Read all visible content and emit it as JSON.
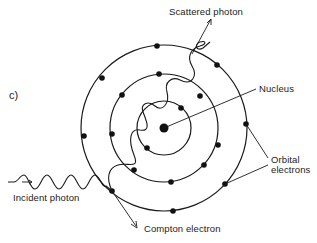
{
  "figure": {
    "panel_label": "c)"
  },
  "labels": {
    "scattered_photon": "Scattered photon",
    "nucleus": "Nucleus",
    "orbital_electrons_line1": "Orbital",
    "orbital_electrons_line2": "electrons",
    "incident_photon": "Incident photon",
    "compton_electron": "Compton electron"
  },
  "atom": {
    "center": [
      164,
      128
    ],
    "nucleus_radius": 4.5,
    "shells": [
      {
        "name": "inner",
        "radius": 27,
        "electrons": 2
      },
      {
        "name": "middle",
        "radius": 54,
        "electrons": 6
      },
      {
        "name": "outer",
        "radius": 83,
        "electrons": 8
      }
    ]
  },
  "colors": {
    "ink": "#1a1a1a",
    "background": "#ffffff"
  }
}
